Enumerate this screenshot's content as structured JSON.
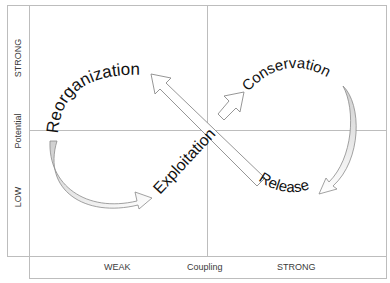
{
  "diagram": {
    "type": "adaptive-cycle",
    "phases": {
      "reorganization": "Reorganization",
      "conservation": "Conservation",
      "exploitation": "Exploitation",
      "release": "Release"
    },
    "x_axis": {
      "title": "Coupling",
      "low_label": "WEAK",
      "high_label": "STRONG"
    },
    "y_axis": {
      "title": "Potential",
      "low_label": "LOW",
      "high_label": "STRONG"
    },
    "colors": {
      "frame": "#bdbdbd",
      "text": "#111111",
      "arrow_outline": "#8a8a8a",
      "arrow_fill": "#ffffff",
      "curve_fill": "#d9d9d9"
    }
  }
}
